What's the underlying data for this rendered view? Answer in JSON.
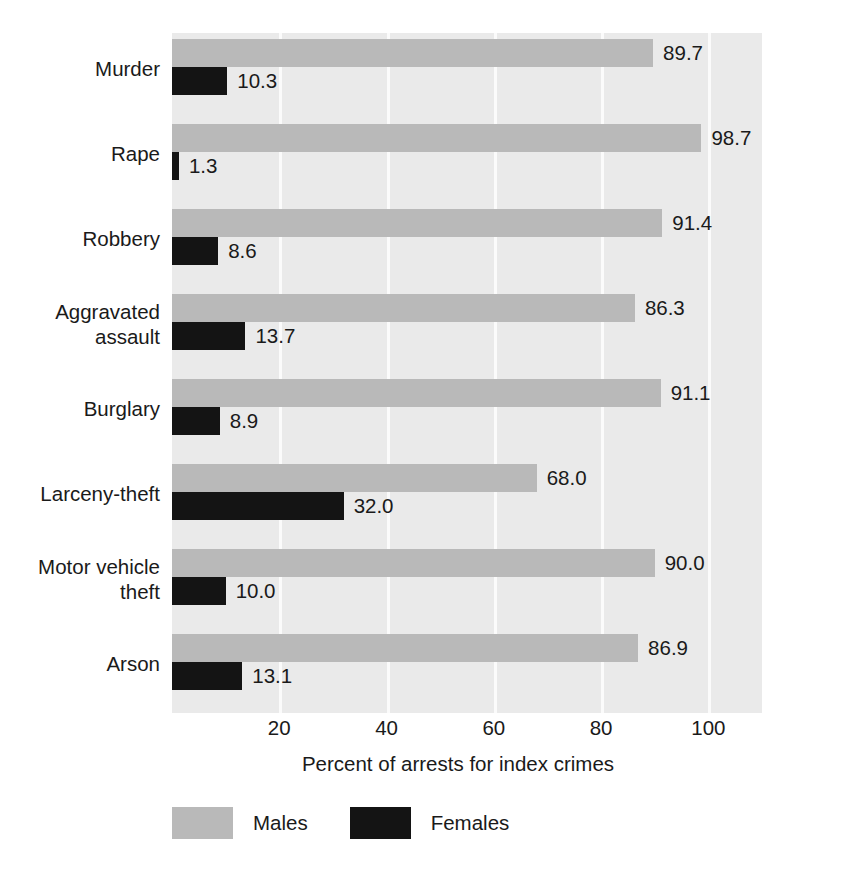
{
  "chart_data": {
    "type": "bar",
    "orientation": "horizontal",
    "title": "",
    "xlabel": "Percent of arrests for index crimes",
    "ylabel": "",
    "xlim": [
      0,
      110
    ],
    "xticks": [
      20,
      40,
      60,
      80,
      100
    ],
    "xtick_labels": [
      "20",
      "40",
      "60",
      "80",
      "100"
    ],
    "grid": true,
    "grid_axis": "x",
    "legend_position": "bottom-left",
    "categories": [
      "Murder",
      "Rape",
      "Robbery",
      "Aggravated\nassault",
      "Burglary",
      "Larceny-theft",
      "Motor vehicle\ntheft",
      "Arson"
    ],
    "series": [
      {
        "name": "Males",
        "color": "#b9b9b9",
        "values": [
          89.7,
          98.7,
          91.4,
          86.3,
          91.1,
          68.0,
          90.0,
          86.9
        ],
        "value_labels": [
          "89.7",
          "98.7",
          "91.4",
          "86.3",
          "91.1",
          "68.0",
          "90.0",
          "86.9"
        ]
      },
      {
        "name": "Females",
        "color": "#141414",
        "values": [
          10.3,
          1.3,
          8.6,
          13.7,
          8.9,
          32.0,
          10.0,
          13.1
        ],
        "value_labels": [
          "10.3",
          "1.3",
          "8.6",
          "13.7",
          "8.9",
          "32.0",
          "10.0",
          "13.1"
        ]
      }
    ]
  },
  "colors": {
    "plot_background": "#eaeaea",
    "gridline": "#fbfbfb",
    "males_bar": "#b9b9b9",
    "females_bar": "#141414",
    "text": "#1a1a1a",
    "page_background": "#ffffff"
  }
}
